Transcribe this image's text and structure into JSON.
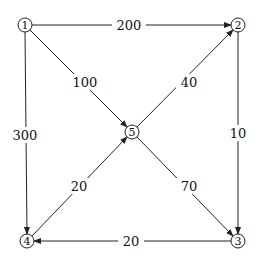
{
  "graph": {
    "nodes": [
      {
        "id": "1",
        "label": "1",
        "x": 25,
        "y": 25
      },
      {
        "id": "2",
        "label": "2",
        "x": 238,
        "y": 25
      },
      {
        "id": "3",
        "label": "3",
        "x": 238,
        "y": 241
      },
      {
        "id": "4",
        "label": "4",
        "x": 27,
        "y": 241
      },
      {
        "id": "5",
        "label": "5",
        "x": 132,
        "y": 132
      }
    ],
    "edges": [
      {
        "from": "1",
        "to": "2",
        "weight": "200"
      },
      {
        "from": "1",
        "to": "5",
        "weight": "100"
      },
      {
        "from": "1",
        "to": "4",
        "weight": "300"
      },
      {
        "from": "5",
        "to": "2",
        "weight": "40"
      },
      {
        "from": "2",
        "to": "3",
        "weight": "10"
      },
      {
        "from": "5",
        "to": "3",
        "weight": "70"
      },
      {
        "from": "4",
        "to": "5",
        "weight": "20"
      },
      {
        "from": "3",
        "to": "4",
        "weight": "20"
      }
    ]
  }
}
